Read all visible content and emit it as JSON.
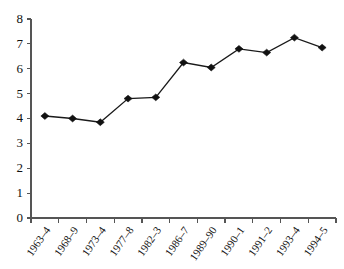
{
  "chart_data": {
    "type": "line",
    "title": "",
    "subtitle": "",
    "xlabel": "",
    "ylabel": "",
    "categories": [
      "1963–4",
      "1968–9",
      "1973–4",
      "1977–8",
      "1982–3",
      "1986–7",
      "1989–90",
      "1990–1",
      "1991–2",
      "1993–4",
      "1994–5"
    ],
    "values": [
      4.1,
      4.0,
      3.85,
      4.8,
      4.85,
      6.25,
      6.05,
      6.8,
      6.65,
      7.25,
      6.85
    ],
    "series": [
      {
        "name": "series-1",
        "values": [
          4.1,
          4.0,
          3.85,
          4.8,
          4.85,
          6.25,
          6.05,
          6.8,
          6.65,
          7.25,
          6.85
        ]
      }
    ],
    "ylim": [
      0,
      8
    ],
    "ytick_labels": [
      "0",
      "1",
      "2",
      "3",
      "4",
      "5",
      "6",
      "7",
      "8"
    ],
    "ytick_values": [
      0,
      1,
      2,
      3,
      4,
      5,
      6,
      7,
      8
    ],
    "grid": false,
    "legend": false,
    "legend_position": "none",
    "marker": "diamond",
    "line_color": "#1a1a1a",
    "marker_color": "#111111",
    "axis_color": "#555555",
    "background_color": "#ffffff"
  }
}
